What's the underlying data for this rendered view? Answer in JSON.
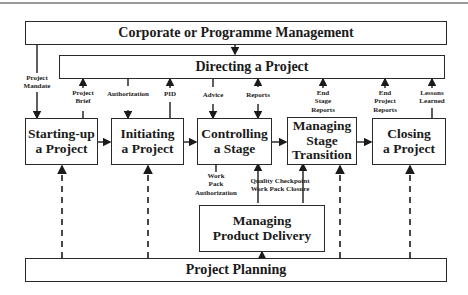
{
  "diagram": {
    "bars": {
      "corporate": "Corporate or Programme Management",
      "directing": "Directing a Project",
      "planning": "Project Planning"
    },
    "processes": [
      {
        "id": "starting-up",
        "line1": "Starting-up",
        "line2": "a Project"
      },
      {
        "id": "initiating",
        "line1": "Initiating",
        "line2": "a Project"
      },
      {
        "id": "controlling",
        "line1": "Controlling",
        "line2": "a Stage"
      },
      {
        "id": "managing-stage",
        "line1": "Managing",
        "line2": "Stage",
        "line3": "Transition"
      },
      {
        "id": "closing",
        "line1": "Closing",
        "line2": "a Project"
      }
    ],
    "delivery": {
      "line1": "Managing",
      "line2": "Product Delivery"
    },
    "flows": {
      "project_mandate": [
        "Project",
        "Mandate"
      ],
      "project_brief": [
        "Project",
        "Brief"
      ],
      "authorization": "Authorization",
      "pid": "PID",
      "advice": "Advice",
      "reports": "Reports",
      "end_stage_reports": [
        "End",
        "Stage",
        "Reports"
      ],
      "end_project_reports": [
        "End",
        "Project",
        "Reports"
      ],
      "lessons_learned": [
        "Lessons",
        "Learned"
      ],
      "work_pack_authorization": [
        "Work",
        "Pack",
        "Authorization"
      ],
      "quality_checkpoint": [
        "Quality Checkpoint",
        "Work Pack Closure"
      ]
    }
  }
}
